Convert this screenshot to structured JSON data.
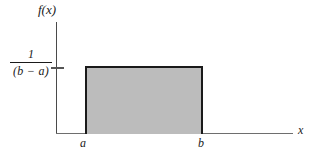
{
  "figure": {
    "background_color": "#ffffff"
  },
  "axes": {
    "y_axis_label": "f(x)",
    "x_axis_label": "x",
    "y_tick_label": {
      "numerator": "1",
      "denominator": "(b − a)"
    },
    "x_tick_labels": [
      "a",
      "b"
    ]
  },
  "colors": {
    "fill": "#bcbcbc",
    "outline": "#1a1a1a",
    "axis": "#4a4a4a",
    "x_axis": "#6e6e6e"
  },
  "chart_data": {
    "type": "area",
    "title": "",
    "subtitle": "",
    "xlabel": "x",
    "ylabel": "f(x)",
    "xlim": [
      "a",
      "b"
    ],
    "ylim": [
      0,
      "1/(b - a)"
    ],
    "grid": false,
    "legend": "none",
    "series": [
      {
        "name": "f(x)",
        "description": "Uniform density: constant height 1/(b − a) over interval [a, b], zero elsewhere",
        "x": [
          "a",
          "b"
        ],
        "values": [
          "1/(b - a)",
          "1/(b - a)"
        ],
        "fill": "#bcbcbc",
        "outline": "#1a1a1a"
      }
    ],
    "annotations": [
      {
        "text": "f(x)",
        "position": "y-axis-top"
      },
      {
        "text": "1\n(b − a)",
        "position": "y-axis-tick"
      },
      {
        "text": "a",
        "position": "x-axis-left-edge-of-rectangle"
      },
      {
        "text": "b",
        "position": "x-axis-right-edge-of-rectangle"
      },
      {
        "text": "x",
        "position": "x-axis-right-end"
      }
    ]
  }
}
